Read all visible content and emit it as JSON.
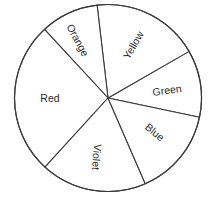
{
  "chart_data": {
    "type": "pie",
    "title": "",
    "legend": "none (labels drawn inside slices)",
    "start_angle_deg": -11.9,
    "direction": "counterclockwise",
    "unit": "sixtieths of the circle (each = 6 degrees)",
    "categories": [
      "Green",
      "Yellow",
      "Orange",
      "Red",
      "Violet",
      "Blue"
    ],
    "values": [
      7,
      11,
      6,
      16,
      11,
      9
    ],
    "degrees": [
      42,
      66,
      36,
      96,
      66,
      54
    ],
    "percentages": [
      11.7,
      18.3,
      10.0,
      26.7,
      18.3,
      15.0
    ],
    "colors": {
      "fill": "#ffffff",
      "stroke": "#3a3a3a",
      "text": "#2a2a2a",
      "background": "#ffffff"
    }
  },
  "geometry": {
    "cx": 108,
    "cy": 98,
    "r": 93.5,
    "boundary_angles_deg": [
      -11.9,
      29.9,
      96.7,
      132.8,
      227.6,
      293.5
    ]
  },
  "slices": [
    {
      "label": "Green",
      "start": -11.9,
      "end": 29.9,
      "label_x": 167,
      "label_y": 90,
      "label_rotate": -8
    },
    {
      "label": "Yellow",
      "start": 29.9,
      "end": 96.7,
      "label_x": 133,
      "label_y": 45,
      "label_rotate": -60
    },
    {
      "label": "Orange",
      "start": 96.7,
      "end": 132.8,
      "label_x": 78,
      "label_y": 40,
      "label_rotate": 62
    },
    {
      "label": "Red",
      "start": 132.8,
      "end": 227.6,
      "label_x": 50,
      "label_y": 98,
      "label_rotate": 0
    },
    {
      "label": "Violet",
      "start": 227.6,
      "end": 293.5,
      "label_x": 97,
      "label_y": 157,
      "label_rotate": 95
    },
    {
      "label": "Blue",
      "start": 293.5,
      "end": 348.1,
      "label_x": 155,
      "label_y": 132,
      "label_rotate": 40
    }
  ]
}
